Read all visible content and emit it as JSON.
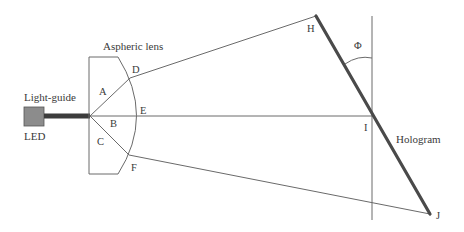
{
  "diagram": {
    "type": "optical-schematic",
    "components": {
      "led": {
        "label": "LED",
        "fill": "#8c8c8c"
      },
      "light_guide": {
        "label": "Light-guide",
        "color": "#3c3c3c"
      },
      "lens": {
        "label": "Aspheric lens"
      },
      "hologram": {
        "label": "Hologram",
        "color": "#4a4a4a"
      }
    },
    "points": {
      "A": "A",
      "B": "B",
      "C": "C",
      "D": "D",
      "E": "E",
      "F": "F",
      "H": "H",
      "I": "I",
      "J": "J"
    },
    "angle": {
      "label": "Φ"
    }
  }
}
